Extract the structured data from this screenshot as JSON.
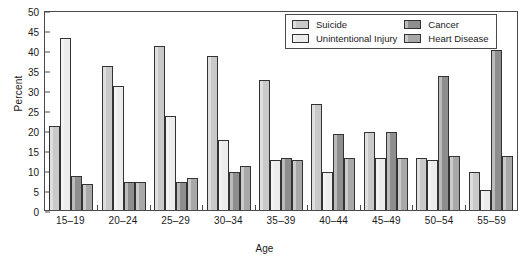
{
  "chart_data": {
    "type": "bar",
    "title": "",
    "xlabel": "Age",
    "ylabel": "Percent",
    "ylim": [
      0,
      50
    ],
    "yticks": [
      0,
      5,
      10,
      15,
      20,
      25,
      30,
      35,
      40,
      45,
      50
    ],
    "grid": false,
    "legend_position": "top-right",
    "categories": [
      "15–19",
      "20–24",
      "25–29",
      "30–34",
      "35–39",
      "40–44",
      "45–49",
      "50–54",
      "55–59"
    ],
    "series": [
      {
        "name": "Suicide",
        "color": "#c9c9c9",
        "values": [
          21.0,
          36.0,
          41.0,
          38.5,
          32.5,
          26.5,
          19.5,
          13.0,
          9.5
        ]
      },
      {
        "name": "Unintentional Injury",
        "color": "#ececec",
        "values": [
          43.0,
          31.0,
          23.5,
          17.5,
          12.5,
          9.5,
          13.0,
          12.5,
          5.0
        ]
      },
      {
        "name": "Cancer",
        "color": "#8e8e8e",
        "values": [
          8.5,
          7.0,
          7.0,
          9.5,
          13.0,
          19.0,
          19.5,
          33.5,
          40.0
        ]
      },
      {
        "name": "Heart Disease",
        "color": "#a8a8a8",
        "values": [
          6.5,
          7.0,
          8.0,
          11.0,
          12.5,
          13.0,
          13.0,
          13.5,
          13.5
        ]
      }
    ]
  },
  "legend": {
    "items": [
      {
        "label": "Suicide"
      },
      {
        "label": "Cancer"
      },
      {
        "label": "Unintentional Injury"
      },
      {
        "label": "Heart Disease"
      }
    ]
  }
}
